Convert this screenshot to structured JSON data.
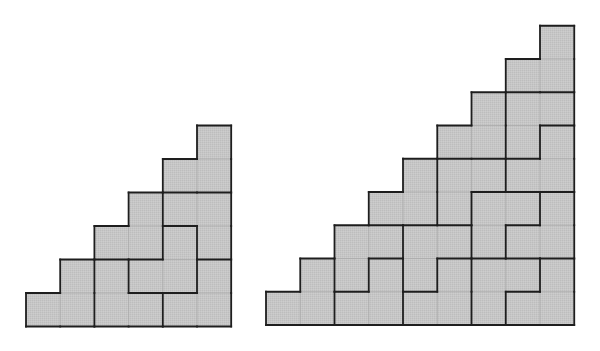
{
  "figure": {
    "colors": {
      "background": "#ffffff",
      "cell_fill": "#c6c6c6",
      "thin_line": "#aaaaaa",
      "thick_line": "#1e1e1e"
    },
    "staircases": [
      {
        "id": "staircase-6",
        "steps": 6,
        "origin_left": 26,
        "origin_bottom": 326.5,
        "cell_w": 34.2,
        "cell_h": 33.5,
        "tile": "L-tromino",
        "pieces": [
          [
            [
              0,
              0
            ],
            [
              1,
              0
            ],
            [
              1,
              1
            ]
          ],
          [
            [
              2,
              0
            ],
            [
              2,
              1
            ],
            [
              3,
              0
            ]
          ],
          [
            [
              3,
              1
            ],
            [
              4,
              1
            ],
            [
              4,
              2
            ]
          ],
          [
            [
              4,
              0
            ],
            [
              5,
              0
            ],
            [
              5,
              1
            ]
          ],
          [
            [
              2,
              2
            ],
            [
              3,
              2
            ],
            [
              3,
              3
            ]
          ],
          [
            [
              4,
              3
            ],
            [
              5,
              3
            ],
            [
              5,
              2
            ]
          ],
          [
            [
              4,
              4
            ],
            [
              5,
              4
            ],
            [
              5,
              5
            ]
          ]
        ]
      },
      {
        "id": "staircase-9",
        "steps": 9,
        "origin_left": 266,
        "origin_bottom": 325,
        "cell_w": 34.25,
        "cell_h": 33.25,
        "tile": "L-tromino",
        "pieces": [
          [
            [
              0,
              0
            ],
            [
              1,
              0
            ],
            [
              1,
              1
            ]
          ],
          [
            [
              2,
              0
            ],
            [
              3,
              0
            ],
            [
              3,
              1
            ]
          ],
          [
            [
              2,
              1
            ],
            [
              2,
              2
            ],
            [
              3,
              2
            ]
          ],
          [
            [
              4,
              0
            ],
            [
              5,
              0
            ],
            [
              5,
              1
            ]
          ],
          [
            [
              4,
              1
            ],
            [
              4,
              2
            ],
            [
              5,
              2
            ]
          ],
          [
            [
              3,
              3
            ],
            [
              4,
              3
            ],
            [
              4,
              4
            ]
          ],
          [
            [
              5,
              3
            ],
            [
              5,
              4
            ],
            [
              6,
              4
            ]
          ],
          [
            [
              5,
              5
            ],
            [
              6,
              5
            ],
            [
              6,
              6
            ]
          ],
          [
            [
              6,
              0
            ],
            [
              6,
              1
            ],
            [
              7,
              1
            ]
          ],
          [
            [
              7,
              0
            ],
            [
              8,
              0
            ],
            [
              8,
              1
            ]
          ],
          [
            [
              6,
              2
            ],
            [
              6,
              3
            ],
            [
              7,
              3
            ]
          ],
          [
            [
              7,
              2
            ],
            [
              8,
              2
            ],
            [
              8,
              3
            ]
          ],
          [
            [
              7,
              4
            ],
            [
              8,
              4
            ],
            [
              8,
              5
            ]
          ],
          [
            [
              7,
              5
            ],
            [
              7,
              6
            ],
            [
              8,
              6
            ]
          ],
          [
            [
              7,
              7
            ],
            [
              8,
              7
            ],
            [
              8,
              8
            ]
          ]
        ]
      }
    ]
  }
}
